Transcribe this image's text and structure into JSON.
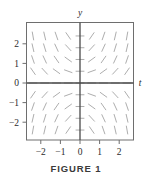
{
  "figure": {
    "caption": "FIGURE 1",
    "background_color": "#ffffff",
    "frame_color": "#6e6e6e",
    "axis_color": "#4a4a4a",
    "segment_color": "#a9a9a9",
    "text_color": "#2b2b2b"
  },
  "chart_data": {
    "type": "scatter",
    "plot_kind": "slope-field",
    "title": "FIGURE 1",
    "xlabel": "t",
    "ylabel": "y",
    "equation": "dy/dt = t*y",
    "grid": false,
    "legend": null,
    "xlim": [
      -2.7,
      2.7
    ],
    "ylim": [
      -2.7,
      2.7
    ],
    "xticks": [
      -2,
      -1,
      0,
      1,
      2
    ],
    "xtick_labels": [
      "−2",
      "−1",
      "0",
      "1",
      "2"
    ],
    "yticks": [
      -2,
      -1,
      0,
      1,
      2
    ],
    "ytick_labels": [
      "−2",
      "−1",
      "0",
      "1",
      "2"
    ],
    "axis_label_positions": {
      "y": "top-of-vertical-axis",
      "t": "right-of-horizontal-axis"
    },
    "sample_x": [
      -2.4,
      -1.8,
      -1.2,
      -0.6,
      0,
      0.6,
      1.2,
      1.8,
      2.4
    ],
    "sample_y": [
      2.4,
      1.8,
      1.2,
      0.6,
      0,
      -0.6,
      -1.2,
      -1.8,
      -2.4
    ],
    "segment_length": 8,
    "slopes": [
      [
        -5.76,
        -4.32,
        -2.88,
        -1.44,
        0,
        1.44,
        2.88,
        4.32,
        5.76
      ],
      [
        -4.32,
        -3.24,
        -2.16,
        -1.08,
        0,
        1.08,
        2.16,
        3.24,
        4.32
      ],
      [
        -2.88,
        -2.16,
        -1.44,
        -0.72,
        0,
        0.72,
        1.44,
        2.16,
        2.88
      ],
      [
        -1.44,
        -1.08,
        -0.72,
        -0.36,
        0,
        0.36,
        0.72,
        1.08,
        1.44
      ],
      [
        0,
        0,
        0,
        0,
        0,
        0,
        0,
        0,
        0
      ],
      [
        1.44,
        1.08,
        0.72,
        0.36,
        0,
        -0.36,
        -0.72,
        -1.08,
        -1.44
      ],
      [
        2.88,
        2.16,
        1.44,
        0.72,
        0,
        -0.72,
        -1.44,
        -2.16,
        -2.88
      ],
      [
        4.32,
        3.24,
        2.16,
        1.08,
        0,
        -1.08,
        -2.16,
        -3.24,
        -4.32
      ],
      [
        5.76,
        4.32,
        2.88,
        1.44,
        0,
        -1.44,
        -2.88,
        -4.32,
        -5.76
      ]
    ]
  }
}
